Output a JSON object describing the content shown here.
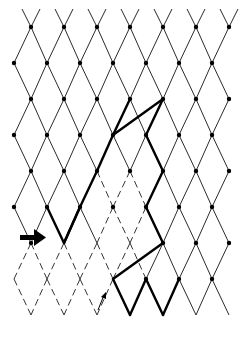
{
  "diagram": {
    "title": "",
    "colors": {
      "background": "#ffffff",
      "line": "#2a2a2a",
      "bold_path": "#000000",
      "node": "#000000"
    },
    "grid": {
      "col_spacing": 33,
      "row_spacing": 36,
      "row_offset_even_x": 31,
      "row_offset_odd_x": 14,
      "first_row_y": 27,
      "rows": 9,
      "cols": 7
    },
    "annotations": {
      "input_arrow": {
        "icon": "right-arrow-icon",
        "x": 22,
        "y": 238
      },
      "small_arrow": {
        "icon": "up-right-arrow-icon",
        "x": 104,
        "y": 293
      }
    }
  }
}
